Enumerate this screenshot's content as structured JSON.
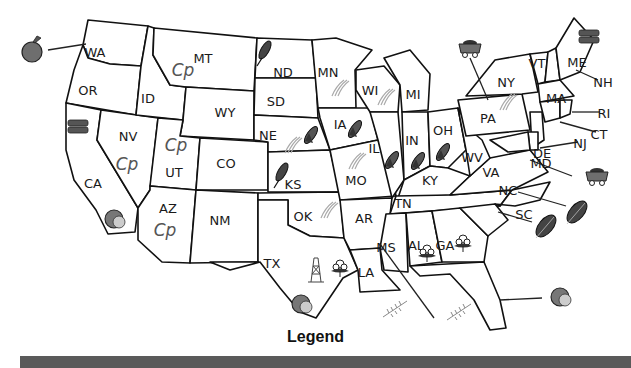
{
  "map": {
    "type": "US natural resources / products map",
    "states": [
      {
        "abbr": "WA",
        "x": 95,
        "y": 52
      },
      {
        "abbr": "OR",
        "x": 88,
        "y": 90
      },
      {
        "abbr": "ID",
        "x": 148,
        "y": 98
      },
      {
        "abbr": "MT",
        "x": 203,
        "y": 58
      },
      {
        "abbr": "WY",
        "x": 225,
        "y": 112
      },
      {
        "abbr": "ND",
        "x": 283,
        "y": 72
      },
      {
        "abbr": "SD",
        "x": 276,
        "y": 101
      },
      {
        "abbr": "NE",
        "x": 268,
        "y": 135
      },
      {
        "abbr": "KS",
        "x": 293,
        "y": 184
      },
      {
        "abbr": "MN",
        "x": 328,
        "y": 72
      },
      {
        "abbr": "IA",
        "x": 340,
        "y": 124
      },
      {
        "abbr": "MO",
        "x": 356,
        "y": 180
      },
      {
        "abbr": "WI",
        "x": 370,
        "y": 90
      },
      {
        "abbr": "MI",
        "x": 413,
        "y": 94
      },
      {
        "abbr": "IL",
        "x": 374,
        "y": 148
      },
      {
        "abbr": "IN",
        "x": 412,
        "y": 140
      },
      {
        "abbr": "OH",
        "x": 443,
        "y": 130
      },
      {
        "abbr": "KY",
        "x": 430,
        "y": 180
      },
      {
        "abbr": "TN",
        "x": 403,
        "y": 203
      },
      {
        "abbr": "WV",
        "x": 472,
        "y": 157
      },
      {
        "abbr": "VA",
        "x": 491,
        "y": 172
      },
      {
        "abbr": "NC",
        "x": 508,
        "y": 190
      },
      {
        "abbr": "SC",
        "x": 524,
        "y": 214
      },
      {
        "abbr": "GA",
        "x": 445,
        "y": 245
      },
      {
        "abbr": "AL",
        "x": 416,
        "y": 245
      },
      {
        "abbr": "MS",
        "x": 386,
        "y": 247
      },
      {
        "abbr": "LA",
        "x": 366,
        "y": 272
      },
      {
        "abbr": "AR",
        "x": 364,
        "y": 218
      },
      {
        "abbr": "OK",
        "x": 303,
        "y": 216
      },
      {
        "abbr": "TX",
        "x": 272,
        "y": 263
      },
      {
        "abbr": "NM",
        "x": 220,
        "y": 220
      },
      {
        "abbr": "CO",
        "x": 226,
        "y": 163
      },
      {
        "abbr": "UT",
        "x": 174,
        "y": 172
      },
      {
        "abbr": "AZ",
        "x": 168,
        "y": 208
      },
      {
        "abbr": "NV",
        "x": 128,
        "y": 136
      },
      {
        "abbr": "CA",
        "x": 93,
        "y": 183
      },
      {
        "abbr": "PA",
        "x": 488,
        "y": 118
      },
      {
        "abbr": "NY",
        "x": 506,
        "y": 82
      },
      {
        "abbr": "VT",
        "x": 537,
        "y": 63
      },
      {
        "abbr": "ME",
        "x": 577,
        "y": 62
      },
      {
        "abbr": "NH",
        "x": 603,
        "y": 82
      },
      {
        "abbr": "MA",
        "x": 556,
        "y": 98
      },
      {
        "abbr": "RI",
        "x": 604,
        "y": 113
      },
      {
        "abbr": "CT",
        "x": 599,
        "y": 134
      },
      {
        "abbr": "NJ",
        "x": 580,
        "y": 143
      },
      {
        "abbr": "DE",
        "x": 542,
        "y": 153
      },
      {
        "abbr": "MD",
        "x": 541,
        "y": 163
      }
    ],
    "symbols": [
      {
        "icon": "apple-icon",
        "state": "WA",
        "x": 32,
        "y": 50,
        "color": "#6e6e6e"
      },
      {
        "icon": "copper-icon",
        "state": "MT",
        "x": 183,
        "y": 70
      },
      {
        "icon": "copper-icon",
        "state": "NV",
        "x": 127,
        "y": 164
      },
      {
        "icon": "copper-icon",
        "state": "UT",
        "x": 176,
        "y": 145
      },
      {
        "icon": "copper-icon",
        "state": "AZ",
        "x": 165,
        "y": 230
      },
      {
        "icon": "lumber-icon",
        "state": "CA",
        "x": 78,
        "y": 126,
        "color": "#555555"
      },
      {
        "icon": "lumber-icon",
        "state": "ME",
        "x": 589,
        "y": 36,
        "color": "#555555"
      },
      {
        "icon": "wheat-icon",
        "state": "ND",
        "x": 265,
        "y": 50
      },
      {
        "icon": "wheat-icon",
        "state": "KS",
        "x": 282,
        "y": 172
      },
      {
        "icon": "corn-icon",
        "state": "NE",
        "x": 311,
        "y": 135
      },
      {
        "icon": "corn-icon",
        "state": "IA",
        "x": 355,
        "y": 129
      },
      {
        "icon": "corn-icon",
        "state": "IL",
        "x": 392,
        "y": 160
      },
      {
        "icon": "corn-icon",
        "state": "IN",
        "x": 418,
        "y": 161
      },
      {
        "icon": "corn-icon",
        "state": "OH",
        "x": 443,
        "y": 152
      },
      {
        "icon": "dairy-icon",
        "state": "MN",
        "x": 338,
        "y": 88
      },
      {
        "icon": "dairy-icon",
        "state": "WI",
        "x": 384,
        "y": 97
      },
      {
        "icon": "dairy-icon",
        "state": "NE",
        "x": 291,
        "y": 145
      },
      {
        "icon": "dairy-icon",
        "state": "MO",
        "x": 355,
        "y": 161
      },
      {
        "icon": "dairy-icon",
        "state": "OK",
        "x": 327,
        "y": 210
      },
      {
        "icon": "dairy-icon",
        "state": "PA",
        "x": 506,
        "y": 102
      },
      {
        "icon": "coal-cart-icon",
        "state": "PA",
        "x": 470,
        "y": 48,
        "color": "#6e6e6e"
      },
      {
        "icon": "coal-cart-icon",
        "state": "MD",
        "x": 597,
        "y": 176,
        "color": "#6e6e6e"
      },
      {
        "icon": "tobacco-leaf-icon",
        "state": "NC",
        "x": 577,
        "y": 212,
        "color": "#444444"
      },
      {
        "icon": "tobacco-leaf-icon",
        "state": "SC",
        "x": 546,
        "y": 226,
        "color": "#444444"
      },
      {
        "icon": "cotton-icon",
        "state": "AL",
        "x": 427,
        "y": 253
      },
      {
        "icon": "cotton-icon",
        "state": "GA",
        "x": 463,
        "y": 243
      },
      {
        "icon": "cotton-icon",
        "state": "TX",
        "x": 340,
        "y": 268
      },
      {
        "icon": "oil-derrick-icon",
        "state": "TX",
        "x": 316,
        "y": 270
      },
      {
        "icon": "citrus-icon",
        "state": "CA",
        "x": 116,
        "y": 219,
        "color": "#777777"
      },
      {
        "icon": "citrus-icon",
        "state": "TX",
        "x": 303,
        "y": 304,
        "color": "#777777"
      },
      {
        "icon": "citrus-icon",
        "state": "FL",
        "x": 562,
        "y": 297,
        "color": "#777777"
      },
      {
        "icon": "rice-icon",
        "state": "LA",
        "x": 395,
        "y": 309
      },
      {
        "icon": "rice-icon",
        "state": "MS",
        "x": 459,
        "y": 312
      }
    ]
  },
  "legend": {
    "title": "Legend"
  }
}
